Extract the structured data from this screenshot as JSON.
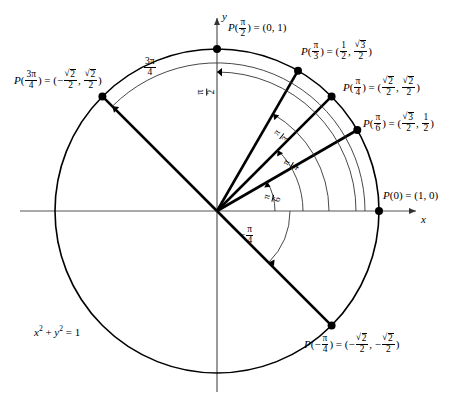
{
  "figure": {
    "type": "unit-circle-diagram",
    "equation_label": "x² + y² = 1",
    "axis_x_label": "x",
    "axis_y_label": "y",
    "circle": {
      "center_x": 217,
      "center_y": 211,
      "radius": 162
    }
  },
  "axes": {
    "x": "x",
    "y": "y"
  },
  "points": [
    {
      "id": "p-0",
      "angle_label": "P(0)",
      "coord_label": "= (1, 0)",
      "arg_text": "0",
      "x_text": "1",
      "y_text": "0",
      "angle_rad": 0,
      "dot_x": 379,
      "dot_y": 211
    },
    {
      "id": "p-pi-6",
      "angle_label": "P(π/6)",
      "coord_label": "= (√3/2, 1/2)",
      "arg_text": "π/6",
      "x_text": "√3/2",
      "y_text": "1/2",
      "angle_rad": 0.5235987756,
      "dot_x": 357,
      "dot_y": 130
    },
    {
      "id": "p-pi-4",
      "angle_label": "P(π/4)",
      "coord_label": "= (√2/2, √2/2)",
      "arg_text": "π/4",
      "x_text": "√2/2",
      "y_text": "√2/2",
      "angle_rad": 0.7853981634,
      "dot_x": 332,
      "dot_y": 96
    },
    {
      "id": "p-pi-3",
      "angle_label": "P(π/3)",
      "coord_label": "= (1/2, √3/2)",
      "arg_text": "π/3",
      "x_text": "1/2",
      "y_text": "√3/2",
      "angle_rad": 1.0471975512,
      "dot_x": 298,
      "dot_y": 71
    },
    {
      "id": "p-pi-2",
      "angle_label": "P(π/2)",
      "coord_label": "= (0, 1)",
      "arg_text": "π/2",
      "x_text": "0",
      "y_text": "1",
      "angle_rad": 1.5707963268,
      "dot_x": 217,
      "dot_y": 49
    },
    {
      "id": "p-3pi-4",
      "angle_label": "P(3π/4)",
      "coord_label": "= (−√2/2, √2/2)",
      "arg_text": "3π/4",
      "x_text": "−√2/2",
      "y_text": "√2/2",
      "angle_rad": 2.3561944902,
      "dot_x": 102,
      "dot_y": 96
    },
    {
      "id": "p-neg-pi-4",
      "angle_label": "P(−π/4)",
      "coord_label": "= (−√2/2, −√2/2)",
      "arg_text": "−π/4",
      "x_text": "−√2/2",
      "y_text": "−√2/2",
      "angle_rad": -0.7853981634,
      "dot_x": 332,
      "dot_y": 326
    }
  ],
  "arc_labels": [
    {
      "id": "arc-pi-6",
      "text": "π/6",
      "num": "π",
      "den": "6"
    },
    {
      "id": "arc-pi-4",
      "text": "π/4",
      "num": "π",
      "den": "4"
    },
    {
      "id": "arc-pi-3",
      "text": "π/3",
      "num": "π",
      "den": "3"
    },
    {
      "id": "arc-pi-2",
      "text": "π/2",
      "num": "π",
      "den": "2"
    },
    {
      "id": "arc-3pi-4",
      "text": "3π/4",
      "num": "3π",
      "den": "4"
    },
    {
      "id": "arc-neg-pi-4",
      "text": "−π/4",
      "num": "π",
      "den": "4",
      "sign": "−"
    }
  ],
  "colors": {
    "stroke": "#000000",
    "thin_stroke": "#4d4d4d",
    "background": "#ffffff"
  }
}
